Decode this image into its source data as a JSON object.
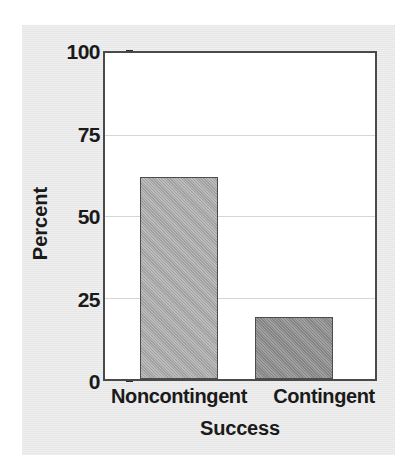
{
  "chart_data": {
    "type": "bar",
    "title": "",
    "subtitle": "",
    "categories": [
      "Noncontingent",
      "Contingent"
    ],
    "values": [
      62,
      19
    ],
    "xlabel": "Success",
    "ylabel": "Percent",
    "ylim": [
      0,
      100
    ],
    "yticks": [
      0,
      25,
      50,
      75,
      100
    ],
    "ytick_labels": [
      "0",
      "25",
      "50",
      "75",
      "100"
    ],
    "grid": true,
    "grid_axis": "y",
    "legend": false,
    "legend_position": "none",
    "bar_colors": [
      "#a9a9a9",
      "#8c8c8c"
    ],
    "annotations": []
  },
  "axes": {
    "y": {
      "label": "Percent",
      "ticks": [
        {
          "value": 100,
          "label": "100"
        },
        {
          "value": 75,
          "label": "75"
        },
        {
          "value": 50,
          "label": "50"
        },
        {
          "value": 25,
          "label": "25"
        },
        {
          "value": 0,
          "label": "0"
        }
      ]
    },
    "x": {
      "label": "Success",
      "ticks": [
        {
          "label": "Noncontingent"
        },
        {
          "label": "Contingent"
        }
      ]
    }
  },
  "style": {
    "page_background": "#ffffff",
    "panel_background": "#e9e9e9",
    "plot_background": "#ffffff",
    "axis_color": "#4a4a4a",
    "grid_color": "#d6d6d6",
    "text_color": "#1a1a1a"
  }
}
